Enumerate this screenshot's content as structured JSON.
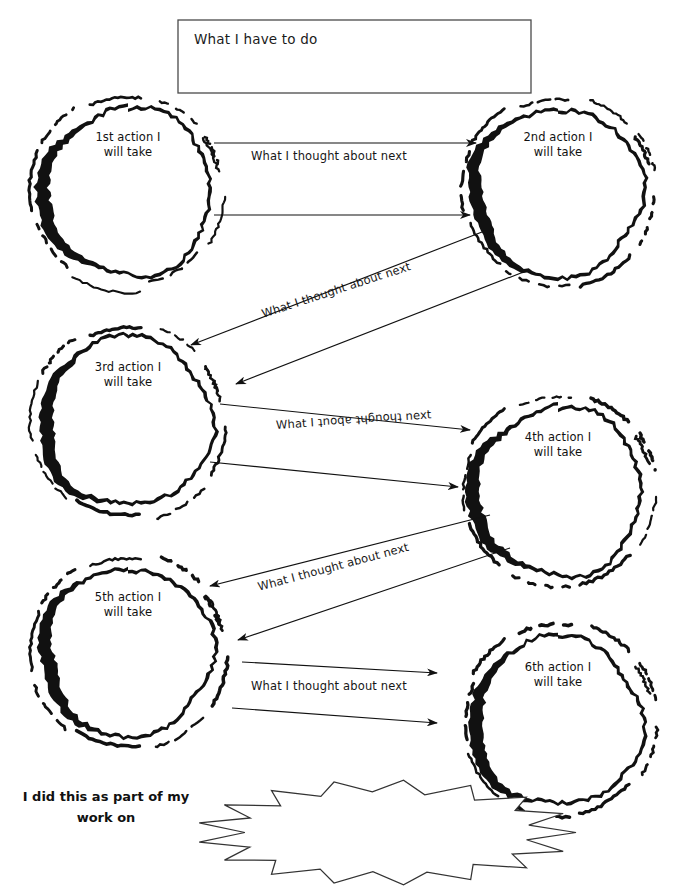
{
  "page": {
    "width": 675,
    "height": 892,
    "background": "#ffffff",
    "ink": "#111111"
  },
  "title_box": {
    "label": "What I have to do",
    "x": 178,
    "y": 20,
    "w": 353,
    "h": 73,
    "border_color": "#4a4a4a"
  },
  "bubbles": [
    {
      "id": "bubble-1",
      "label": "1st action I\nwill take",
      "cx": 128,
      "cy": 192,
      "r": 84
    },
    {
      "id": "bubble-2",
      "label": "2nd action I\nwill take",
      "cx": 558,
      "cy": 192,
      "r": 84
    },
    {
      "id": "bubble-3",
      "label": "3rd action I\nwill take",
      "cx": 128,
      "cy": 422,
      "r": 84
    },
    {
      "id": "bubble-4",
      "label": "4th action I\nwill take",
      "cx": 558,
      "cy": 492,
      "r": 84
    },
    {
      "id": "bubble-5",
      "label": "5th action I\nwill take",
      "cx": 128,
      "cy": 652,
      "r": 84
    },
    {
      "id": "bubble-6",
      "label": "6th action I\nwill take",
      "cx": 558,
      "cy": 722,
      "r": 84
    }
  ],
  "connectors": [
    {
      "id": "connector-1",
      "label": "What I thought about next",
      "from": "bubble-1",
      "to": "bubble-2",
      "direction": "right",
      "label_x": 251,
      "label_y": 149,
      "rotate": 0,
      "lines": [
        {
          "x1": 214,
          "y1": 143,
          "x2": 476,
          "y2": 143,
          "arrow": "end"
        },
        {
          "x1": 214,
          "y1": 215,
          "x2": 470,
          "y2": 215,
          "arrow": "end"
        }
      ]
    },
    {
      "id": "connector-2",
      "label": "What I thought about next",
      "from": "bubble-2",
      "to": "bubble-3",
      "direction": "down-left",
      "label_x": 262,
      "label_y": 307,
      "rotate": -18,
      "lines": [
        {
          "x1": 482,
          "y1": 232,
          "x2": 191,
          "y2": 345,
          "arrow": "end"
        },
        {
          "x1": 526,
          "y1": 271,
          "x2": 236,
          "y2": 384,
          "arrow": "end"
        }
      ]
    },
    {
      "id": "connector-3",
      "label": "What I thought about next",
      "from": "bubble-3",
      "to": "bubble-4",
      "direction": "right",
      "label_x": 276,
      "label_y": 418,
      "rotate": -4,
      "lines": [
        {
          "x1": 220,
          "y1": 404,
          "x2": 470,
          "y2": 430,
          "arrow": "end"
        },
        {
          "x1": 210,
          "y1": 462,
          "x2": 458,
          "y2": 487,
          "arrow": "end"
        }
      ]
    },
    {
      "id": "connector-4",
      "label": "What I thought about next",
      "from": "bubble-4",
      "to": "bubble-5",
      "direction": "down-left",
      "label_x": 258,
      "label_y": 580,
      "rotate": -15,
      "lines": [
        {
          "x1": 490,
          "y1": 515,
          "x2": 210,
          "y2": 586,
          "arrow": "end"
        },
        {
          "x1": 510,
          "y1": 548,
          "x2": 238,
          "y2": 640,
          "arrow": "end"
        }
      ]
    },
    {
      "id": "connector-5",
      "label": "What I thought about next",
      "from": "bubble-5",
      "to": "bubble-6",
      "direction": "right",
      "label_x": 251,
      "label_y": 679,
      "rotate": 0,
      "lines": [
        {
          "x1": 242,
          "y1": 662,
          "x2": 437,
          "y2": 673,
          "arrow": "end"
        },
        {
          "x1": 232,
          "y1": 708,
          "x2": 437,
          "y2": 723,
          "arrow": "end"
        }
      ]
    }
  ],
  "footer": {
    "label": "I did this as part of my\nwork on",
    "x": 12,
    "y": 786,
    "w": 188
  },
  "starburst": {
    "x": 196,
    "y": 780,
    "w": 380,
    "h": 105,
    "border_color": "#333333"
  }
}
